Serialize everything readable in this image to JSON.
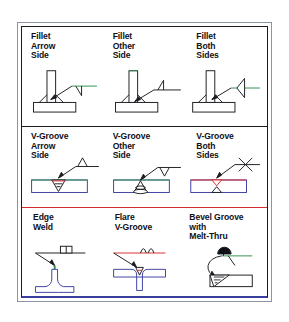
{
  "figure": {
    "type": "welding-symbol-reference-chart",
    "background_color": "#ffffff",
    "frame": {
      "outer_border_color": "#8d93a3",
      "inner_border_color": "#1c1c20",
      "bottom_accent_color": "#3b3fa0"
    },
    "dividers": [
      {
        "name": "fillet-vgroove-divider",
        "color": "#1c1c20"
      },
      {
        "name": "vgroove-special-divider",
        "color": "#d52b2b"
      }
    ],
    "colors": {
      "line": "#1c1c20",
      "metal_outline": "#3b3fa0",
      "reference_green": "#2f8f4e",
      "reference_red": "#d52b2b",
      "weld_red": "#d52b2b",
      "melt_thru_fill": "#101018"
    }
  },
  "rows": [
    {
      "name": "fillet-welds",
      "cells": [
        {
          "name": "fillet-arrow-side",
          "label": "Fillet\nArrow\nSide",
          "symbol": "fillet-triangle-below-reference-line",
          "joint": "tee-joint-one-side-fillet"
        },
        {
          "name": "fillet-other-side",
          "label": "Fillet\nOther\nSide",
          "symbol": "fillet-triangle-above-reference-line",
          "joint": "tee-joint-one-side-fillet"
        },
        {
          "name": "fillet-both-sides",
          "label": "Fillet\nBoth\nSides",
          "symbol": "fillet-triangles-both-sides-of-reference-line",
          "joint": "tee-joint-two-side-fillet"
        }
      ]
    },
    {
      "name": "v-groove-welds",
      "cells": [
        {
          "name": "vgroove-arrow-side",
          "label": "V-Groove\nArrow\nSide",
          "symbol": "v-below-reference-line",
          "joint": "butt-joint-v-groove-top"
        },
        {
          "name": "vgroove-other-side",
          "label": "V-Groove\nOther\nSide",
          "symbol": "v-above-reference-line",
          "joint": "butt-joint-v-groove-bottom"
        },
        {
          "name": "vgroove-both-sides",
          "label": "V-Groove\nBoth\nSides",
          "symbol": "double-v-x-symbol",
          "joint": "butt-joint-double-v-groove"
        }
      ]
    },
    {
      "name": "special-welds",
      "cells": [
        {
          "name": "edge-weld",
          "label": "Edge\nWeld",
          "symbol": "edge-weld-two-parallel-bars",
          "joint": "flanged-edge-joint"
        },
        {
          "name": "flare-v-groove",
          "label": "Flare\nV-Groove",
          "symbol": "flare-v-double-arc",
          "joint": "tee-joint-flare-v"
        },
        {
          "name": "bevel-groove-melt-thru",
          "label": "Bevel Groove\nwith\nMelt-Thru",
          "symbol": "bevel-with-filled-melt-thru-dot",
          "joint": "butt-joint-bevel-groove"
        }
      ]
    }
  ]
}
